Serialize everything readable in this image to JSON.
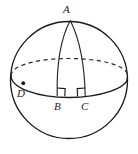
{
  "figure": {
    "background_color": "#ffffff",
    "line_color": "#1a1a1a",
    "canvas": {
      "width": 138,
      "height": 154
    },
    "sphere": {
      "name": "sphere-outline",
      "center_x": 69,
      "center_y": 80,
      "radius": 59
    },
    "equator": {
      "name": "equator-ellipse",
      "center_x": 69,
      "center_y": 76,
      "radius_x": 58,
      "radius_y": 18,
      "front_half_style": "solid",
      "back_half_style": "dashed"
    },
    "labels": {
      "apex": "A",
      "left_point": "D",
      "base_left": "B",
      "base_right": "C"
    },
    "points": {
      "A": {
        "x": 70,
        "y": 20
      },
      "B": {
        "x": 58,
        "y": 96
      },
      "C": {
        "x": 85,
        "y": 96
      },
      "D": {
        "x": 23,
        "y": 83
      }
    },
    "right_angles": [
      {
        "at": "B",
        "size": 8
      },
      {
        "at": "C",
        "size": 8
      }
    ],
    "meridians": [
      {
        "name": "meridian-A-to-B",
        "from": "A",
        "to": "B"
      },
      {
        "name": "meridian-A-to-C",
        "from": "A",
        "to": "C"
      }
    ]
  }
}
